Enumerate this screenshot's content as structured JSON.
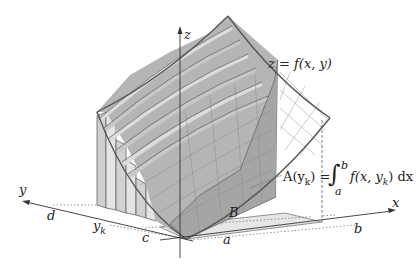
{
  "diagram": {
    "type": "3d-surface-volume-slicing",
    "colors": {
      "background": "#ffffff",
      "surface_stroke": "#555555",
      "slab_fill_dark": "#b9b9b9",
      "slab_fill_light": "#dedede",
      "cross_section_fill": "#a9a9a9",
      "base_region_fill": "#e6e6e6",
      "grid_stroke": "#8a8a8a",
      "axis_stroke": "#333333"
    },
    "axes": {
      "x_label": "x",
      "y_label": "y",
      "z_label": "z"
    },
    "labels": {
      "surface": "z = f(x, y)",
      "region": "B",
      "x_lower": "a",
      "x_upper": "b",
      "y_lower": "c",
      "y_upper": "d",
      "y_k": "y",
      "y_k_sub": "k",
      "area_lhs": "A(y",
      "area_lhs_sub": "k",
      "area_lhs_close": ") =",
      "integral_sign": "∫",
      "integral_upper": "b",
      "integral_lower": "a",
      "integrand": "f(x, y",
      "integrand_sub": "k",
      "integrand_close": ") dx"
    }
  }
}
